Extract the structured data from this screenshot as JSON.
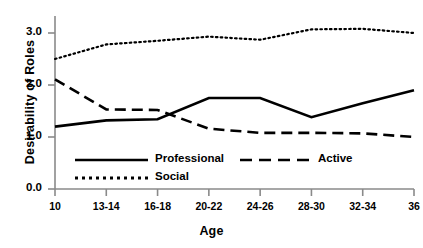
{
  "chart_data": {
    "type": "line",
    "title": "",
    "xlabel": "Age",
    "ylabel": "Desirability of Roles",
    "categories": [
      "10",
      "13-14",
      "16-18",
      "20-22",
      "24-26",
      "28-30",
      "32-34",
      "36"
    ],
    "xtick_labels": [
      "10",
      "13-14",
      "16-18",
      "20-22",
      "24-26",
      "28-30",
      "32-34",
      "36"
    ],
    "ytick_labels": [
      "0.0",
      "1.0",
      "2.0",
      "3.0"
    ],
    "ytick_values": [
      0.0,
      1.0,
      2.0,
      3.0
    ],
    "ylim": [
      0.0,
      3.4
    ],
    "grid": false,
    "legend_position": "inside-lower-center",
    "series": [
      {
        "name": "Professional",
        "style": "solid",
        "values": [
          1.2,
          1.32,
          1.34,
          1.75,
          1.75,
          1.38,
          1.65,
          1.9
        ]
      },
      {
        "name": "Active",
        "style": "dashed",
        "values": [
          2.11,
          1.53,
          1.52,
          1.16,
          1.08,
          1.08,
          1.07,
          1.0
        ]
      },
      {
        "name": "Social",
        "style": "dotted",
        "values": [
          2.5,
          2.78,
          2.85,
          2.93,
          2.87,
          3.07,
          3.08,
          3.0
        ]
      }
    ]
  },
  "legend": {
    "entries": [
      {
        "label": "Professional",
        "style": "solid"
      },
      {
        "label": "Active",
        "style": "dashed"
      },
      {
        "label": "Social",
        "style": "dotted"
      }
    ]
  },
  "colors": {
    "line": "#000000",
    "axis": "#808080",
    "background": "#ffffff"
  }
}
